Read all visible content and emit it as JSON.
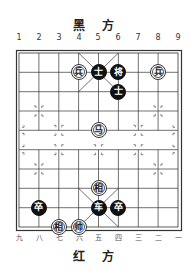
{
  "top_label": "黑 方",
  "bottom_label": "红 方",
  "top_column_numbers": [
    "1",
    "2",
    "3",
    "4",
    "5",
    "6",
    "7",
    "8",
    "9"
  ],
  "bottom_column_numbers": [
    "九",
    "八",
    "七",
    "六",
    "五",
    "四",
    "三",
    "二",
    "一"
  ],
  "board": {
    "columns": 9,
    "rows": 10
  },
  "pieces": [
    {
      "char": "兵",
      "side": "red",
      "col": 3,
      "row": 1
    },
    {
      "char": "士",
      "side": "black",
      "col": 4,
      "row": 1
    },
    {
      "char": "将",
      "side": "black",
      "col": 5,
      "row": 1
    },
    {
      "char": "兵",
      "side": "red",
      "col": 7,
      "row": 1
    },
    {
      "char": "士",
      "side": "black",
      "col": 5,
      "row": 2
    },
    {
      "char": "马",
      "side": "red",
      "col": 4,
      "row": 4
    },
    {
      "char": "相",
      "side": "red",
      "col": 4,
      "row": 7
    },
    {
      "char": "卒",
      "side": "black",
      "col": 1,
      "row": 8
    },
    {
      "char": "车",
      "side": "black",
      "col": 4,
      "row": 8
    },
    {
      "char": "卒",
      "side": "black",
      "col": 5,
      "row": 8
    },
    {
      "char": "相",
      "side": "red",
      "col": 2,
      "row": 9
    },
    {
      "char": "帅",
      "side": "red",
      "col": 3,
      "row": 9
    }
  ]
}
